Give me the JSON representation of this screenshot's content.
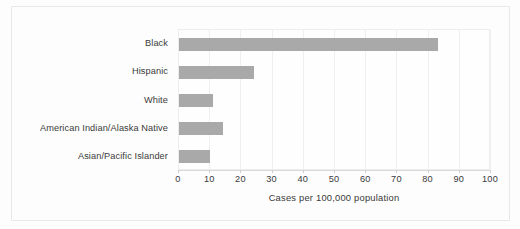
{
  "chart_data": {
    "type": "bar",
    "orientation": "horizontal",
    "title": "",
    "subtitle": "",
    "xlabel": "Cases per 100,000 population",
    "ylabel": "",
    "categories": [
      "Black",
      "Hispanic",
      "White",
      "American Indian/Alaska Native",
      "Asian/Pacific Islander"
    ],
    "values": [
      83,
      24,
      11,
      14,
      10
    ],
    "xlim": [
      0,
      100
    ],
    "xticks": [
      0,
      10,
      20,
      30,
      40,
      50,
      60,
      70,
      80,
      90,
      100
    ],
    "xtick_labels": [
      "0",
      "10",
      "20",
      "30",
      "40",
      "50",
      "60",
      "70",
      "80",
      "90",
      "100"
    ],
    "grid": true,
    "grid_axis": "x",
    "legend": false,
    "legend_position": "none",
    "annotations": [],
    "colors": {
      "bar": "#a9a9a9",
      "grid": "#efefed",
      "axis": "#d9d9d7",
      "text": "#3a3a3a",
      "plot_background": "#fefefe",
      "figure_background": "#fdfdfc",
      "card_border": "#e8e8e6"
    }
  }
}
